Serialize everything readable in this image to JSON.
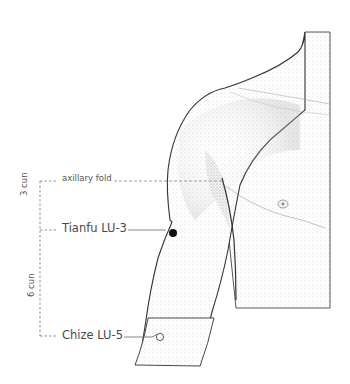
{
  "diagram": {
    "labels": {
      "axillary_fold": "axillary fold",
      "tianfu": "Tianfu LU-3",
      "chize": "Chize LU-5",
      "measure_upper": "3 cun",
      "measure_lower": "6 cun"
    },
    "points": [
      {
        "name": "Tianfu LU-3",
        "marker": "filled-circle",
        "color": "#111111"
      },
      {
        "name": "Chize LU-5",
        "marker": "open-circle",
        "color": "#ffffff"
      }
    ],
    "colors": {
      "outline": "#333333",
      "shading": "#9a9a9a",
      "leader": "#666666",
      "guide": "#777777"
    }
  }
}
